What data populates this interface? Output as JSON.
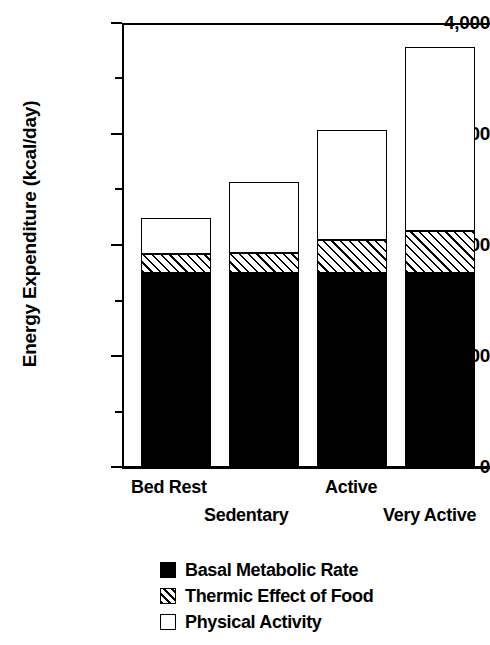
{
  "chart_data": {
    "type": "bar",
    "stacked": true,
    "title": "",
    "xlabel": "",
    "ylabel": "Energy Expenditure (kcal/day)",
    "categories": [
      "Bed Rest",
      "Sedentary",
      "Active",
      "Very Active"
    ],
    "series": [
      {
        "name": "Basal Metabolic Rate",
        "fill": "solid-black",
        "values": [
          1750,
          1750,
          1750,
          1750
        ]
      },
      {
        "name": "Thermic Effect of Food",
        "fill": "diagonal-hatch",
        "values": [
          170,
          180,
          300,
          380
        ]
      },
      {
        "name": "Physical Activity",
        "fill": "white",
        "values": [
          330,
          640,
          990,
          1650
        ]
      }
    ],
    "totals": [
      2250,
      2570,
      3040,
      3780
    ],
    "ylim": [
      0,
      4000
    ],
    "ytick_labels": [
      "0",
      "1,000",
      "2,000",
      "3,000",
      "4,000"
    ],
    "ytick_values": [
      0,
      1000,
      2000,
      3000,
      4000
    ],
    "yminor_values": [
      500,
      1500,
      2500,
      3500
    ],
    "grid": false,
    "legend_position": "bottom"
  },
  "axis": {
    "y_title": "Energy Expenditure (kcal/day)",
    "ticks": [
      {
        "label": "4,000",
        "value": 4000
      },
      {
        "label": "3,000",
        "value": 3000
      },
      {
        "label": "2,000",
        "value": 2000
      },
      {
        "label": "1,000",
        "value": 1000
      },
      {
        "label": "0",
        "value": 0
      }
    ]
  },
  "xaxis": {
    "labels": [
      {
        "text": "Bed Rest",
        "row": "upper"
      },
      {
        "text": "Sedentary",
        "row": "lower"
      },
      {
        "text": "Active",
        "row": "upper"
      },
      {
        "text": "Very Active",
        "row": "lower"
      }
    ]
  },
  "legend": {
    "items": [
      {
        "label": "Basal Metabolic Rate",
        "swatch": "solid-black-swatch"
      },
      {
        "label": "Thermic Effect of Food",
        "swatch": "hatched-swatch"
      },
      {
        "label": "Physical Activity",
        "swatch": "white-swatch"
      }
    ]
  }
}
